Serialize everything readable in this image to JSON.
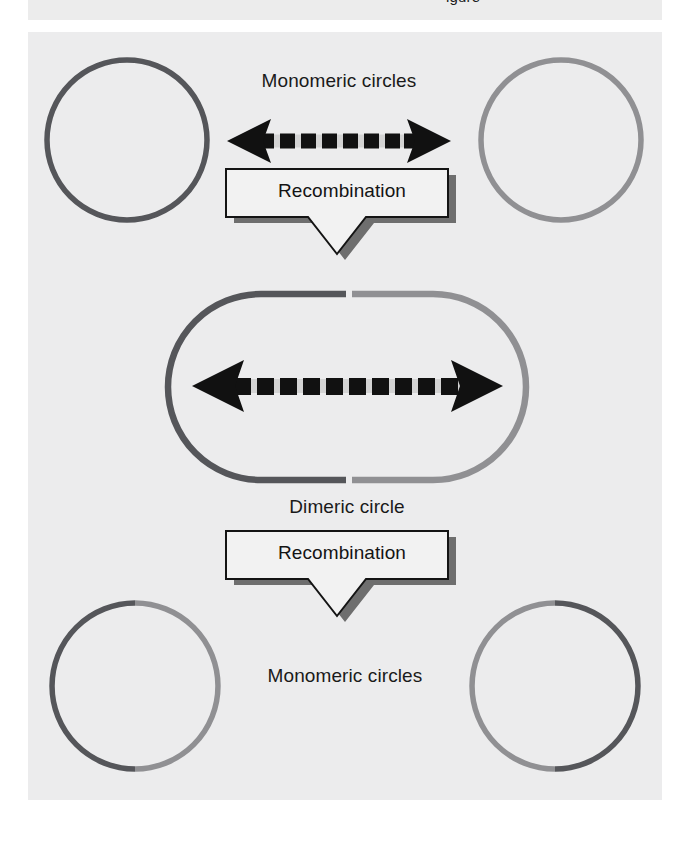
{
  "page": {
    "background": "#ffffff",
    "panel_background": "#ececed",
    "top_strip_clipped_text": "igure"
  },
  "colors": {
    "dark_dna": "#55565a",
    "light_dna": "#909093",
    "arrow_black": "#111111",
    "arrow_band": "#d3d3d3",
    "banner_fill": "#f2f2f2",
    "banner_outline": "#141414",
    "banner_shadow": "#6e6e6e",
    "text": "#1a1a1a"
  },
  "labels": {
    "monomeric_top": "Monomeric circles",
    "dimeric": "Dimeric circle",
    "monomeric_bottom": "Monomeric circles"
  },
  "steps": [
    {
      "id": "recombination-1",
      "label": "Recombination"
    },
    {
      "id": "recombination-2",
      "label": "Recombination"
    }
  ],
  "molecules": {
    "top_left_circle": {
      "name": "monomeric-circle-dark",
      "segments": [
        {
          "color": "#55565a",
          "fraction": 1.0
        }
      ]
    },
    "top_right_circle": {
      "name": "monomeric-circle-light",
      "segments": [
        {
          "color": "#909093",
          "fraction": 1.0
        }
      ]
    },
    "dimeric_circle": {
      "name": "dimeric-circle",
      "segments": [
        {
          "color": "#55565a",
          "fraction": 0.5
        },
        {
          "color": "#909093",
          "fraction": 0.5
        }
      ]
    },
    "bottom_left_circle": {
      "name": "recombinant-circle-left",
      "segments": [
        {
          "color": "#55565a",
          "fraction": 0.5
        },
        {
          "color": "#909093",
          "fraction": 0.5
        }
      ]
    },
    "bottom_right_circle": {
      "name": "recombinant-circle-right",
      "segments": [
        {
          "color": "#909093",
          "fraction": 0.5
        },
        {
          "color": "#55565a",
          "fraction": 0.5
        }
      ]
    }
  },
  "arrows": {
    "top_dashed": {
      "name": "dashed-double-arrow",
      "direction": "bidirectional",
      "dash_count": 7
    },
    "dimer_dashed": {
      "name": "dashed-double-arrow",
      "direction": "bidirectional",
      "dash_count": 10
    }
  }
}
